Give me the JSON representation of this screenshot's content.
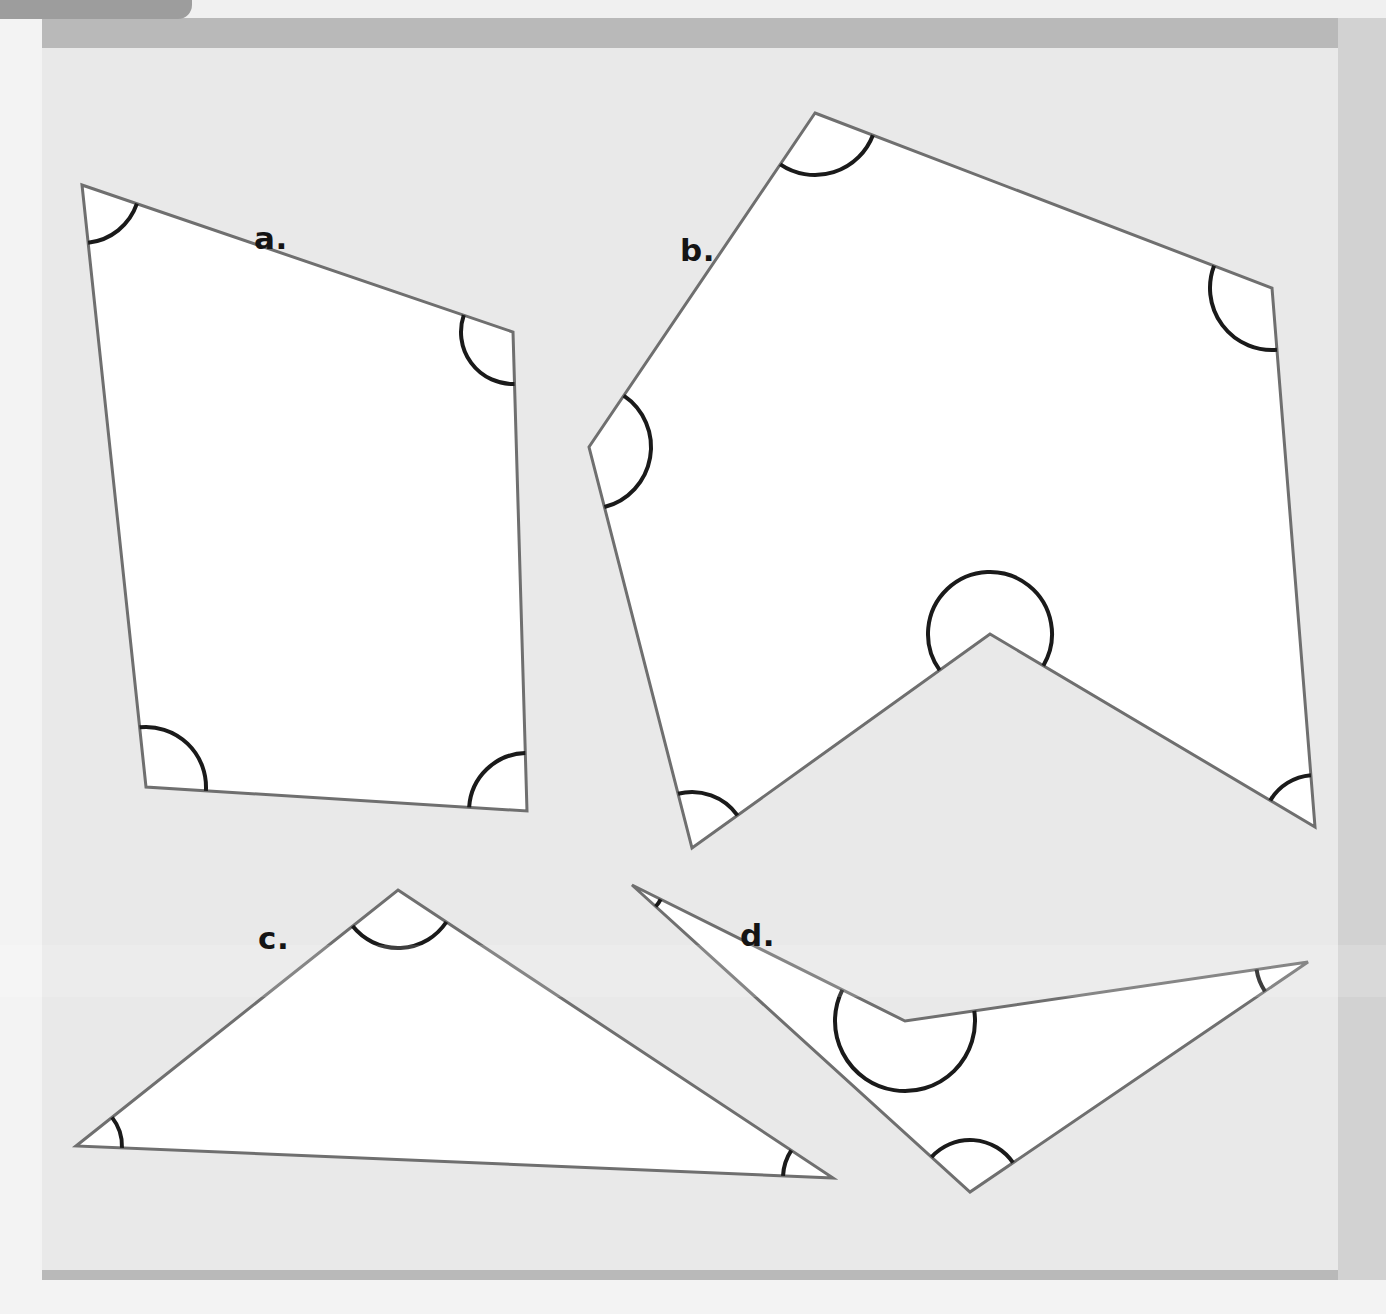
{
  "page": {
    "background_color": "#e9e9e9",
    "frame_color": "#b9b9b9",
    "tab_color": "#9d9d9d",
    "shape_fill": "#ffffff",
    "shape_stroke": "#6f6f6f",
    "arc_stroke": "#1a1a1a"
  },
  "labels": {
    "a": "a.",
    "b": "b.",
    "c": "c.",
    "d": "d."
  },
  "chart_data": {
    "type": "diagram",
    "shapes": [
      {
        "id": "a",
        "label": "a.",
        "kind": "quadrilateral",
        "convex": true,
        "vertex_count": 4,
        "marked_angle_count": 4,
        "vertices": [
          [
            82,
            185
          ],
          [
            513,
            332
          ],
          [
            527,
            811
          ],
          [
            146,
            787
          ]
        ],
        "label_position": [
          254,
          220
        ],
        "angles": [
          {
            "vertex_index": 0,
            "radius": 58,
            "type": "acute"
          },
          {
            "vertex_index": 1,
            "radius": 52,
            "type": "obtuse"
          },
          {
            "vertex_index": 2,
            "radius": 58,
            "type": "right"
          },
          {
            "vertex_index": 3,
            "radius": 60,
            "type": "right"
          }
        ]
      },
      {
        "id": "b",
        "label": "b.",
        "kind": "concave hexagon",
        "convex": false,
        "vertex_count": 6,
        "marked_angle_count": 6,
        "vertices": [
          [
            815,
            113
          ],
          [
            1272,
            288
          ],
          [
            1315,
            827
          ],
          [
            990,
            634
          ],
          [
            692,
            848
          ],
          [
            589,
            447
          ]
        ],
        "label_position": [
          680,
          232
        ],
        "angles": [
          {
            "vertex_index": 0,
            "radius": 62,
            "type": "obtuse"
          },
          {
            "vertex_index": 1,
            "radius": 62,
            "type": "obtuse"
          },
          {
            "vertex_index": 2,
            "radius": 52,
            "type": "acute"
          },
          {
            "vertex_index": 3,
            "radius": 62,
            "type": "reflex"
          },
          {
            "vertex_index": 4,
            "radius": 56,
            "type": "acute"
          },
          {
            "vertex_index": 5,
            "radius": 62,
            "type": "obtuse"
          }
        ]
      },
      {
        "id": "c",
        "label": "c.",
        "kind": "triangle",
        "convex": true,
        "vertex_count": 3,
        "marked_angle_count": 3,
        "vertices": [
          [
            398,
            890
          ],
          [
            833,
            1178
          ],
          [
            76,
            1146
          ]
        ],
        "label_position": [
          258,
          920
        ],
        "angles": [
          {
            "vertex_index": 0,
            "radius": 58,
            "type": "obtuse"
          },
          {
            "vertex_index": 1,
            "radius": 50,
            "type": "acute"
          },
          {
            "vertex_index": 2,
            "radius": 46,
            "type": "acute"
          }
        ]
      },
      {
        "id": "d",
        "label": "d.",
        "kind": "concave quadrilateral",
        "convex": false,
        "vertex_count": 4,
        "marked_angle_count": 4,
        "vertices": [
          [
            632,
            885
          ],
          [
            905,
            1021
          ],
          [
            1308,
            962
          ],
          [
            970,
            1192
          ]
        ],
        "label_position": [
          740,
          917
        ],
        "angles": [
          {
            "vertex_index": 0,
            "radius": 32,
            "type": "acute"
          },
          {
            "vertex_index": 1,
            "radius": 70,
            "type": "reflex"
          },
          {
            "vertex_index": 2,
            "radius": 52,
            "type": "acute"
          },
          {
            "vertex_index": 3,
            "radius": 52,
            "type": "acute"
          }
        ]
      }
    ]
  }
}
